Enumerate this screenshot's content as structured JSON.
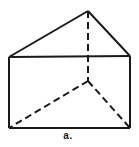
{
  "figure": {
    "kind": "triangular-prism-wireframe",
    "label": "a.",
    "background": "#ffffff",
    "stroke_color": "#1a1a1a",
    "stroke_width": 2,
    "dash_pattern": "7 4",
    "width": 139,
    "height": 147,
    "vertices": {
      "top-back-vertex": [
        88,
        11
      ],
      "top-left-vertex": [
        9,
        57
      ],
      "top-right-vertex": [
        130,
        56
      ],
      "bottom-left-vertex": [
        9,
        128
      ],
      "bottom-right-vertex": [
        130,
        128
      ],
      "bottom-back-vertex": [
        88,
        81
      ]
    },
    "edges": [
      {
        "name": "top-face-left-edge",
        "from": "top-back-vertex",
        "to": "top-left-vertex",
        "style": "solid"
      },
      {
        "name": "top-face-right-edge",
        "from": "top-back-vertex",
        "to": "top-right-vertex",
        "style": "solid"
      },
      {
        "name": "top-face-front-edge",
        "from": "top-left-vertex",
        "to": "top-right-vertex",
        "style": "solid"
      },
      {
        "name": "left-vertical-edge",
        "from": "top-left-vertex",
        "to": "bottom-left-vertex",
        "style": "solid"
      },
      {
        "name": "right-vertical-edge",
        "from": "top-right-vertex",
        "to": "bottom-right-vertex",
        "style": "solid"
      },
      {
        "name": "bottom-front-edge",
        "from": "bottom-left-vertex",
        "to": "bottom-right-vertex",
        "style": "solid"
      },
      {
        "name": "back-vertical-edge",
        "from": "top-back-vertex",
        "to": "bottom-back-vertex",
        "style": "dashed"
      },
      {
        "name": "bottom-back-left-edge",
        "from": "bottom-back-vertex",
        "to": "bottom-left-vertex",
        "style": "dashed"
      },
      {
        "name": "bottom-back-right-edge",
        "from": "bottom-back-vertex",
        "to": "bottom-right-vertex",
        "style": "dashed"
      }
    ]
  }
}
